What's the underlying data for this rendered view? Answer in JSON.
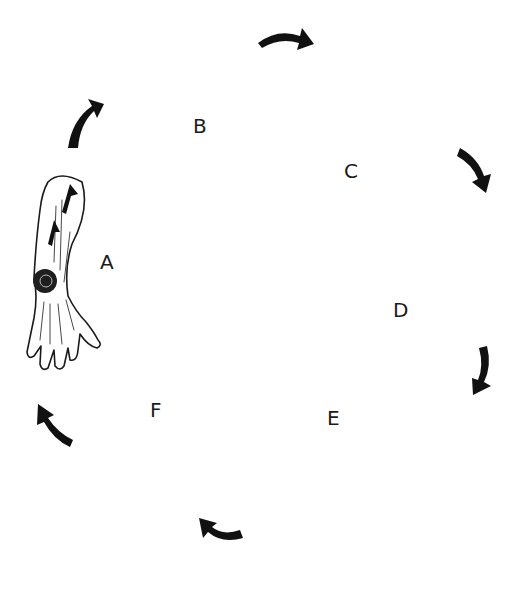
{
  "diagram": {
    "type": "cycle",
    "stages": [
      {
        "id": "A",
        "label": "A",
        "depiction": "arm-with-wound-and-upward-arrows"
      },
      {
        "id": "B",
        "label": "B",
        "depiction": "brain-with-circulating-arrows"
      },
      {
        "id": "C",
        "label": "C",
        "depiction": "nerve-fibers-attached-to-tube"
      },
      {
        "id": "D",
        "label": "D",
        "depiction": "two-tubes-with-arrow-between"
      },
      {
        "id": "E",
        "label": "E",
        "depiction": "shaded-arm"
      },
      {
        "id": "F",
        "label": "F",
        "depiction": "two-cells-with-exchange-arrows"
      }
    ],
    "cycle_direction": "clockwise",
    "colors": {
      "ink": "#1a1a1a",
      "background": "#ffffff"
    }
  }
}
